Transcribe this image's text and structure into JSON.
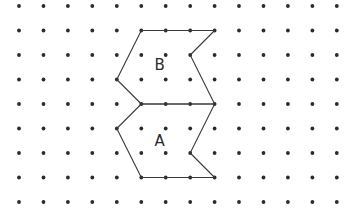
{
  "diagram": {
    "type": "dot-grid-shapes",
    "grid": {
      "columns": 14,
      "rows": 9
    },
    "shapes": [
      {
        "name": "B",
        "label": "B",
        "vertices": [
          [
            5,
            1
          ],
          [
            8,
            1
          ],
          [
            7,
            2
          ],
          [
            8,
            4
          ],
          [
            5,
            4
          ],
          [
            4,
            3
          ]
        ],
        "label_at": [
          5.75,
          2.4
        ]
      },
      {
        "name": "A",
        "label": "A",
        "vertices": [
          [
            5,
            4
          ],
          [
            8,
            4
          ],
          [
            7,
            6
          ],
          [
            8,
            7
          ],
          [
            5,
            7
          ],
          [
            4,
            5
          ]
        ],
        "label_at": [
          5.75,
          5.5
        ]
      }
    ],
    "colors": {
      "dot": "#2b2b2b",
      "line": "#3a3a3a",
      "background": "#ffffff"
    }
  }
}
